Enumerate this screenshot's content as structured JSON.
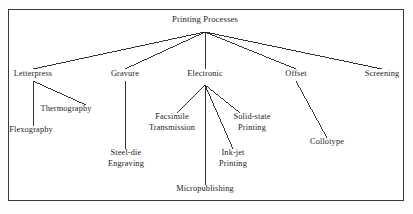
{
  "diagram": {
    "title": "Printing Processes",
    "type": "tree",
    "frame": {
      "border_color": "#3a3a3a",
      "background": "#ffffff"
    },
    "line_color": "#1d1d1d",
    "text_color": "#1d1d1d",
    "nodes": [
      {
        "id": "root",
        "label": "Printing Processes",
        "lines": [
          "Printing Processes"
        ],
        "level": 1,
        "x": 205,
        "y": 22
      },
      {
        "id": "letterpress",
        "label": "Letterpress",
        "lines": [
          "Letterpress"
        ],
        "level": 2,
        "x": 33,
        "y": 77
      },
      {
        "id": "gravure",
        "label": "Gravure",
        "lines": [
          "Gravure"
        ],
        "level": 2,
        "x": 125,
        "y": 77
      },
      {
        "id": "electronic",
        "label": "Electronic",
        "lines": [
          "Electronic"
        ],
        "level": 2,
        "x": 205,
        "y": 77
      },
      {
        "id": "offset",
        "label": "Offset",
        "lines": [
          "Offset"
        ],
        "level": 2,
        "x": 296,
        "y": 77
      },
      {
        "id": "screening",
        "label": "Screening",
        "lines": [
          "Screening"
        ],
        "level": 2,
        "x": 382,
        "y": 77
      },
      {
        "id": "thermography",
        "label": "Thermography",
        "lines": [
          "Thermography"
        ],
        "level": 3,
        "x": 66,
        "y": 112
      },
      {
        "id": "flexography",
        "label": "Flexography",
        "lines": [
          "Flexography"
        ],
        "level": 3,
        "x": 31,
        "y": 133
      },
      {
        "id": "steel-die",
        "label": "Steel-die Engraving",
        "lines": [
          "Steel-die",
          "Engraving"
        ],
        "level": 3,
        "x": 126,
        "y": 156
      },
      {
        "id": "facsimile",
        "label": "Facsimile Transmission",
        "lines": [
          "Facsimile",
          "Transmission"
        ],
        "level": 3,
        "x": 172,
        "y": 120
      },
      {
        "id": "solid-state",
        "label": "Solid-state Printing",
        "lines": [
          "Solid-state",
          "Printing"
        ],
        "level": 3,
        "x": 252,
        "y": 120
      },
      {
        "id": "ink-jet",
        "label": "Ink-jet Printing",
        "lines": [
          "Ink-jet",
          "Printing"
        ],
        "level": 3,
        "x": 233,
        "y": 156
      },
      {
        "id": "micropublishing",
        "label": "Micropublishing",
        "lines": [
          "Micropublishing"
        ],
        "level": 3,
        "x": 205,
        "y": 192
      },
      {
        "id": "collotype",
        "label": "Collotype",
        "lines": [
          "Collotype"
        ],
        "level": 3,
        "x": 327,
        "y": 145
      }
    ],
    "edges": [
      {
        "from": "root",
        "to": "letterpress",
        "x1": 205,
        "y1": 32,
        "x2": 33,
        "y2": 69
      },
      {
        "from": "root",
        "to": "gravure",
        "x1": 205,
        "y1": 32,
        "x2": 125,
        "y2": 69
      },
      {
        "from": "root",
        "to": "electronic",
        "x1": 205,
        "y1": 32,
        "x2": 205,
        "y2": 69
      },
      {
        "from": "root",
        "to": "offset",
        "x1": 205,
        "y1": 32,
        "x2": 296,
        "y2": 69
      },
      {
        "from": "root",
        "to": "screening",
        "x1": 205,
        "y1": 32,
        "x2": 382,
        "y2": 69
      },
      {
        "from": "letterpress",
        "to": "flexography",
        "x1": 33,
        "y1": 81,
        "x2": 33,
        "y2": 126
      },
      {
        "from": "letterpress",
        "to": "thermography",
        "x1": 33,
        "y1": 81,
        "x2": 86,
        "y2": 105
      },
      {
        "from": "gravure",
        "to": "steel-die",
        "x1": 125,
        "y1": 81,
        "x2": 125,
        "y2": 149
      },
      {
        "from": "electronic",
        "to": "facsimile",
        "x1": 205,
        "y1": 85,
        "x2": 177,
        "y2": 113
      },
      {
        "from": "electronic",
        "to": "micropublishing",
        "x1": 205,
        "y1": 85,
        "x2": 205,
        "y2": 185
      },
      {
        "from": "electronic",
        "to": "ink-jet",
        "x1": 205,
        "y1": 85,
        "x2": 233,
        "y2": 149
      },
      {
        "from": "electronic",
        "to": "solid-state",
        "x1": 205,
        "y1": 85,
        "x2": 240,
        "y2": 113
      },
      {
        "from": "offset",
        "to": "collotype",
        "x1": 296,
        "y1": 81,
        "x2": 327,
        "y2": 138
      }
    ]
  }
}
